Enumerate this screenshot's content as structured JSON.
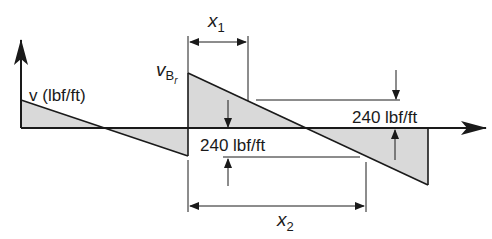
{
  "diagram": {
    "type": "shear-diagram",
    "colors": {
      "line": "#1a1a1a",
      "fill": "#d9d9d9",
      "background": "#ffffff"
    },
    "labels": {
      "vertical_axis": "v (lbf/ft)",
      "jump_value_main": "v",
      "jump_value_sub": "B",
      "jump_value_subsub": "r",
      "x1_main": "x",
      "x1_sub": "1",
      "x2_main": "x",
      "x2_sub": "2",
      "dim_upper": "240 lbf/ft",
      "dim_lower": "240 lbf/ft"
    },
    "segments": [
      {
        "name": "left",
        "from": [
          21,
          100
        ],
        "to": [
          188,
          156
        ]
      },
      {
        "name": "middle",
        "from": [
          188,
          73
        ],
        "to": [
          428,
          185
        ]
      }
    ]
  }
}
